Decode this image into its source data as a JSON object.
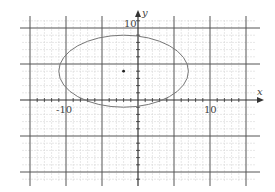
{
  "chart_data": {
    "type": "line",
    "title": "",
    "xlabel": "x",
    "ylabel": "y",
    "xlim": [
      -15,
      15
    ],
    "ylim": [
      -10.5,
      10.5
    ],
    "grid": true,
    "grid_major_step": 5,
    "grid_minor_step": 1,
    "tick_labels": {
      "x": [
        {
          "value": -10,
          "label": "-10"
        },
        {
          "value": 10,
          "label": "10"
        }
      ],
      "y": [
        {
          "value": 10,
          "label": "10"
        }
      ]
    },
    "ellipse": {
      "center": [
        -2,
        4
      ],
      "semi_axis_x": 9,
      "semi_axis_y": 5,
      "equation": "(x+2)^2/81 + (y-4)^2/25 = 1"
    },
    "points": [
      {
        "x": -2,
        "y": 4,
        "label": "center"
      }
    ]
  },
  "labels": {
    "x_axis": "x",
    "y_axis": "y",
    "x_neg10": "-10",
    "x_pos10": "10",
    "y_pos10": "10"
  },
  "colors": {
    "major_grid": "#555555",
    "minor_grid": "#d6d6d6",
    "axis": "#333333",
    "curve": "#777777",
    "point": "#222222"
  }
}
